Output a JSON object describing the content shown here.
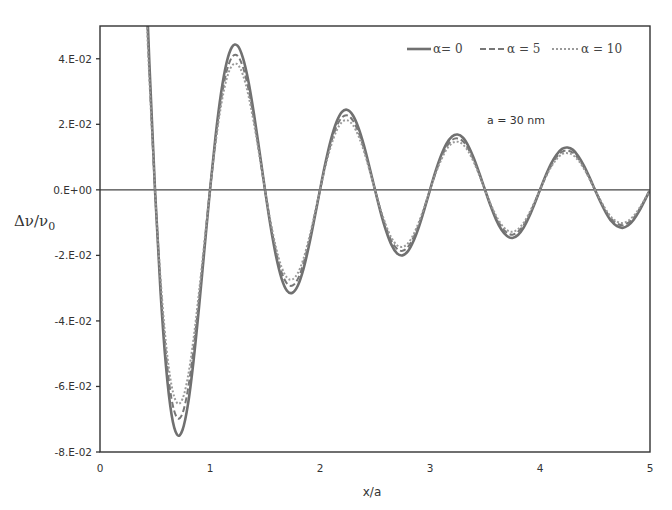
{
  "chart_data": {
    "type": "line",
    "title": "",
    "xlabel": "x/a",
    "ylabel": "Δν/ν0",
    "ylabel_main": "Δν/ν",
    "ylabel_sub": "0",
    "xlim": [
      0,
      5
    ],
    "ylim": [
      -0.08,
      0.05
    ],
    "grid": false,
    "legend_position": "top-right",
    "annotation": "a = 30 nm",
    "x_ticks": [
      0,
      1,
      2,
      3,
      4,
      5
    ],
    "x_tick_labels": [
      "0",
      "1",
      "2",
      "3",
      "4",
      "5"
    ],
    "y_ticks": [
      0.04,
      0.02,
      0.0,
      -0.02,
      -0.04,
      -0.06,
      -0.08
    ],
    "y_tick_labels": [
      "4.E-02",
      "2.E-02",
      "0.E+00",
      "-2.E-02",
      "-4.E-02",
      "-6.E-02",
      "-8.E-02"
    ],
    "x": [
      0.4,
      0.45,
      0.5,
      0.55,
      0.6,
      0.65,
      0.7,
      0.75,
      0.8,
      0.85,
      0.9,
      0.95,
      1.0,
      1.05,
      1.1,
      1.15,
      1.2,
      1.25,
      1.3,
      1.35,
      1.4,
      1.45,
      1.5,
      1.55,
      1.6,
      1.65,
      1.7,
      1.75,
      1.8,
      1.85,
      1.9,
      1.95,
      2.0,
      2.05,
      2.1,
      2.15,
      2.2,
      2.25,
      2.3,
      2.35,
      2.4,
      2.45,
      2.5,
      2.55,
      2.6,
      2.65,
      2.7,
      2.75,
      2.8,
      2.85,
      2.9,
      2.95,
      3.0,
      3.05,
      3.1,
      3.15,
      3.2,
      3.25,
      3.3,
      3.35,
      3.4,
      3.45,
      3.5,
      3.55,
      3.6,
      3.65,
      3.7,
      3.75,
      3.8,
      3.85,
      3.9,
      3.95,
      4.0,
      4.05,
      4.1,
      4.15,
      4.2,
      4.25,
      4.3,
      4.35,
      4.4,
      4.45,
      4.5,
      4.55,
      4.6,
      4.65,
      4.7,
      4.75,
      4.8,
      4.85,
      4.9,
      4.95,
      5.0
    ],
    "series": [
      {
        "name": "α= 0",
        "style": "solid",
        "color": "#707070",
        "values": [
          0.0808,
          0.0378,
          0,
          -0.0309,
          -0.0539,
          -0.0685,
          -0.0747,
          -0.0733,
          -0.0654,
          -0.0523,
          -0.0359,
          -0.0179,
          0,
          0.0162,
          0.0294,
          0.0387,
          0.0436,
          0.044,
          0.0402,
          0.033,
          0.0231,
          0.0117,
          0,
          -0.011,
          -0.0202,
          -0.027,
          -0.0308,
          -0.0314,
          -0.0291,
          -0.0241,
          -0.017,
          -0.0087,
          0,
          0.0083,
          0.0154,
          0.0207,
          0.0238,
          0.0244,
          0.0227,
          0.0189,
          0.0135,
          0.0069,
          0,
          -0.0067,
          -0.0124,
          -0.0168,
          -0.0194,
          -0.02,
          -0.0187,
          -0.0156,
          -0.0112,
          -0.0058,
          0,
          0.0056,
          0.0104,
          0.0141,
          0.0163,
          0.0169,
          0.0159,
          0.0133,
          0.0095,
          0.0049,
          0,
          -0.0048,
          -0.009,
          -0.0122,
          -0.0141,
          -0.0147,
          -0.0138,
          -0.0116,
          -0.0083,
          -0.0043,
          0,
          0.0042,
          0.0079,
          0.0107,
          0.0125,
          0.0129,
          0.0122,
          0.0102,
          0.0073,
          0.0038,
          0,
          -0.0037,
          -0.007,
          -0.0096,
          -0.0111,
          -0.0116,
          -0.0109,
          -0.0092,
          -0.0066,
          -0.0034,
          0
        ]
      },
      {
        "name": "α = 5",
        "style": "dashed",
        "color": "#777777",
        "values": [
          0.0751,
          0.0352,
          0,
          -0.0287,
          -0.0501,
          -0.0637,
          -0.0695,
          -0.0682,
          -0.0608,
          -0.0486,
          -0.0334,
          -0.0166,
          0,
          0.0151,
          0.0273,
          0.036,
          0.0405,
          0.0409,
          0.0374,
          0.0307,
          0.0215,
          0.0109,
          0,
          -0.0102,
          -0.0188,
          -0.0251,
          -0.0286,
          -0.0292,
          -0.0271,
          -0.0224,
          -0.0158,
          -0.0081,
          0,
          0.0077,
          0.0143,
          0.0193,
          0.0221,
          0.0227,
          0.0211,
          0.0176,
          0.0126,
          0.0064,
          0,
          -0.0062,
          -0.0115,
          -0.0156,
          -0.018,
          -0.0186,
          -0.0174,
          -0.0145,
          -0.0104,
          -0.0054,
          0,
          0.0052,
          0.0097,
          0.0131,
          0.0152,
          0.0157,
          0.0148,
          0.0124,
          0.0088,
          0.0046,
          0,
          -0.0045,
          -0.0084,
          -0.0113,
          -0.0131,
          -0.0137,
          -0.0128,
          -0.0108,
          -0.0077,
          -0.004,
          0,
          0.0039,
          0.0073,
          0.01,
          0.0116,
          0.012,
          0.0113,
          0.0095,
          0.0068,
          0.0035,
          0,
          -0.0034,
          -0.0065,
          -0.0089,
          -0.0103,
          -0.0108,
          -0.0101,
          -0.0086,
          -0.0061,
          -0.0032,
          0
        ]
      },
      {
        "name": "α = 10",
        "style": "dotted",
        "color": "#9a9a9a",
        "values": [
          0.0703,
          0.0329,
          0,
          -0.0269,
          -0.0469,
          -0.0596,
          -0.065,
          -0.0638,
          -0.0569,
          -0.0455,
          -0.0312,
          -0.0156,
          0,
          0.0141,
          0.0256,
          0.0337,
          0.0379,
          0.0383,
          0.035,
          0.0287,
          0.0201,
          0.0102,
          0,
          -0.0096,
          -0.0176,
          -0.0235,
          -0.0268,
          -0.0273,
          -0.0253,
          -0.021,
          -0.0148,
          -0.0076,
          0,
          0.0072,
          0.0134,
          0.018,
          0.0207,
          0.0212,
          0.0197,
          0.0164,
          0.0117,
          0.006,
          0,
          -0.0058,
          -0.0108,
          -0.0146,
          -0.0169,
          -0.0174,
          -0.0163,
          -0.0136,
          -0.0097,
          -0.005,
          0,
          0.0049,
          0.009,
          0.0123,
          0.0142,
          0.0147,
          0.0138,
          0.0116,
          0.0083,
          0.0043,
          0,
          -0.0042,
          -0.0078,
          -0.0106,
          -0.0123,
          -0.0128,
          -0.012,
          -0.0101,
          -0.0072,
          -0.0037,
          0,
          0.0037,
          0.0069,
          0.0093,
          0.0109,
          0.0112,
          0.0106,
          0.0089,
          0.0064,
          0.0033,
          0,
          -0.0032,
          -0.0061,
          -0.0084,
          -0.0097,
          -0.0101,
          -0.0095,
          -0.008,
          -0.0057,
          -0.003,
          0
        ]
      }
    ]
  }
}
